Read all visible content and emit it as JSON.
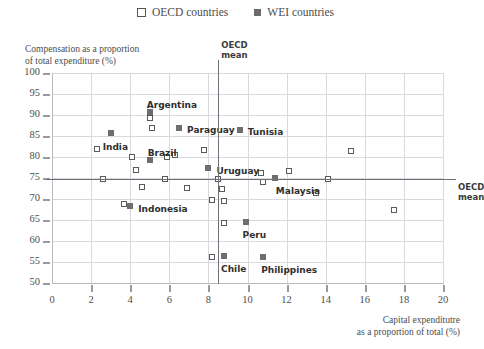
{
  "legend": {
    "items": [
      {
        "label": "OECD countries",
        "marker": "open-square",
        "color": "#ffffff"
      },
      {
        "label": "WEI countries",
        "marker": "filled-square",
        "color": "#6b6b6b"
      }
    ]
  },
  "axes": {
    "y_title_line1": "Compensation as a proportion",
    "y_title_line2": "of total expenditure (%)",
    "x_title_line1": "Capital expenditutre",
    "x_title_line2": "as a proportion of total  (%)"
  },
  "mean_lines": {
    "vertical_label_line1": "OECD",
    "vertical_label_line2": "mean",
    "horizontal_label_line1": "OECD",
    "horizontal_label_line2": "mean",
    "vertical_value": 8.5,
    "horizontal_value": 74.7
  },
  "chart_data": {
    "type": "scatter",
    "title": "",
    "xlabel": "Capital expenditutre as a proportion of total  (%)",
    "ylabel": "Compensation as a proportion of total expenditure (%)",
    "xlim": [
      0,
      20
    ],
    "ylim": [
      50,
      100
    ],
    "xticks": [
      0,
      2,
      4,
      6,
      8,
      10,
      12,
      14,
      16,
      18,
      20
    ],
    "yticks": [
      50,
      55,
      60,
      65,
      70,
      75,
      80,
      85,
      90,
      95,
      100
    ],
    "grid": true,
    "legend_position": "top-center",
    "reference_lines": [
      {
        "orientation": "vertical",
        "value": 8.5,
        "label": "OECD mean"
      },
      {
        "orientation": "horizontal",
        "value": 74.7,
        "label": "OECD mean"
      }
    ],
    "series": [
      {
        "name": "WEI countries",
        "marker": "filled-square",
        "color": "#6e6e6e",
        "points": [
          {
            "label": "India",
            "x": 3.0,
            "y": 85.6,
            "lx": -8,
            "ly": 9
          },
          {
            "label": "Argentina",
            "x": 5.0,
            "y": 90.7,
            "lx": -3,
            "ly": -12
          },
          {
            "label": "Paraguay",
            "x": 6.5,
            "y": 87.0,
            "lx": 8,
            "ly": -3
          },
          {
            "label": "Brazil",
            "x": 5.0,
            "y": 79.4,
            "lx": -2,
            "ly": -12
          },
          {
            "label": "Tunisia",
            "x": 9.6,
            "y": 86.4,
            "lx": 8,
            "ly": -3
          },
          {
            "label": "Uruguay",
            "x": 8.0,
            "y": 77.4,
            "lx": 8,
            "ly": -2
          },
          {
            "label": "Malaysia",
            "x": 11.4,
            "y": 74.9,
            "lx": 1,
            "ly": 8
          },
          {
            "label": "Indonesia",
            "x": 4.0,
            "y": 68.3,
            "lx": 8,
            "ly": -2
          },
          {
            "label": "Peru",
            "x": 9.9,
            "y": 64.5,
            "lx": -3,
            "ly": 8
          },
          {
            "label": "Chile",
            "x": 8.8,
            "y": 56.5,
            "lx": -3,
            "ly": 8
          },
          {
            "label": "Philippines",
            "x": 10.8,
            "y": 56.1,
            "lx": -2,
            "ly": 8
          }
        ]
      },
      {
        "name": "OECD countries",
        "marker": "open-square",
        "color": "#ffffff",
        "points": [
          {
            "x": 5.0,
            "y": 89.2
          },
          {
            "x": 5.1,
            "y": 87.0
          },
          {
            "x": 2.3,
            "y": 81.8
          },
          {
            "x": 4.1,
            "y": 80.0
          },
          {
            "x": 5.9,
            "y": 79.9
          },
          {
            "x": 6.3,
            "y": 80.5
          },
          {
            "x": 7.8,
            "y": 81.6
          },
          {
            "x": 15.3,
            "y": 81.5
          },
          {
            "x": 4.3,
            "y": 77.0
          },
          {
            "x": 10.7,
            "y": 76.3
          },
          {
            "x": 12.1,
            "y": 76.6
          },
          {
            "x": 2.6,
            "y": 74.7
          },
          {
            "x": 5.8,
            "y": 74.7
          },
          {
            "x": 8.5,
            "y": 74.7
          },
          {
            "x": 10.8,
            "y": 74.1
          },
          {
            "x": 14.1,
            "y": 74.7
          },
          {
            "x": 4.6,
            "y": 72.9
          },
          {
            "x": 6.9,
            "y": 72.6
          },
          {
            "x": 8.7,
            "y": 72.5
          },
          {
            "x": 13.5,
            "y": 71.5
          },
          {
            "x": 3.7,
            "y": 68.9
          },
          {
            "x": 8.2,
            "y": 69.7
          },
          {
            "x": 8.8,
            "y": 69.6
          },
          {
            "x": 17.5,
            "y": 67.3
          },
          {
            "x": 8.8,
            "y": 64.3
          },
          {
            "x": 8.2,
            "y": 56.3
          }
        ]
      }
    ]
  }
}
